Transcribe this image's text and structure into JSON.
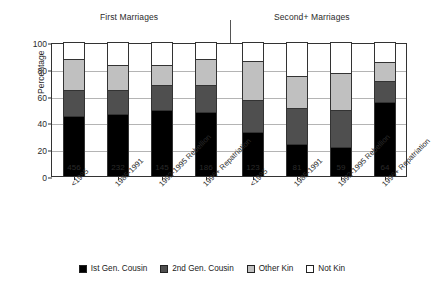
{
  "chart_data": {
    "type": "bar",
    "subtype": "stacked-bar",
    "title": "",
    "xlabel": "",
    "ylabel": "Percentage",
    "ylim": [
      0,
      100
    ],
    "yticks": [
      0,
      20,
      40,
      60,
      80,
      100
    ],
    "grid": true,
    "legend_position": "bottom",
    "groups": [
      {
        "name": "First Marriages"
      },
      {
        "name": "Second+ Marriages"
      }
    ],
    "categories": [
      "<1985",
      "1985-1991",
      "1992-1995 Rebellion",
      "1996+ Repatriation",
      "<1985",
      "1985-1991",
      "1992-1995 Rebellion",
      "1996+ Repatriation"
    ],
    "group_of_category": [
      0,
      0,
      0,
      0,
      1,
      1,
      1,
      1
    ],
    "sample_sizes": [
      456,
      232,
      145,
      186,
      123,
      81,
      59,
      64
    ],
    "series": [
      {
        "name": "Ist Gen. Cousin",
        "color": "#000000",
        "values": [
          45,
          46,
          49,
          48,
          33,
          24,
          22,
          55
        ]
      },
      {
        "name": "2nd Gen. Cousin",
        "color": "#4f4f4f",
        "values": [
          19,
          18,
          19,
          20,
          24,
          27,
          27,
          16
        ]
      },
      {
        "name": "Other Kin",
        "color": "#c0c0c0",
        "values": [
          23,
          19,
          15,
          19,
          29,
          24,
          28,
          14
        ]
      },
      {
        "name": "Not Kin",
        "color": "#ffffff",
        "values": [
          13,
          17,
          17,
          13,
          14,
          25,
          23,
          15
        ]
      }
    ]
  },
  "legend": {
    "items": [
      {
        "label": "Ist Gen. Cousin",
        "color": "#000000"
      },
      {
        "label": "2nd Gen. Cousin",
        "color": "#4f4f4f"
      },
      {
        "label": "Other Kin",
        "color": "#c0c0c0"
      },
      {
        "label": "Not Kin",
        "color": "#ffffff"
      }
    ]
  }
}
